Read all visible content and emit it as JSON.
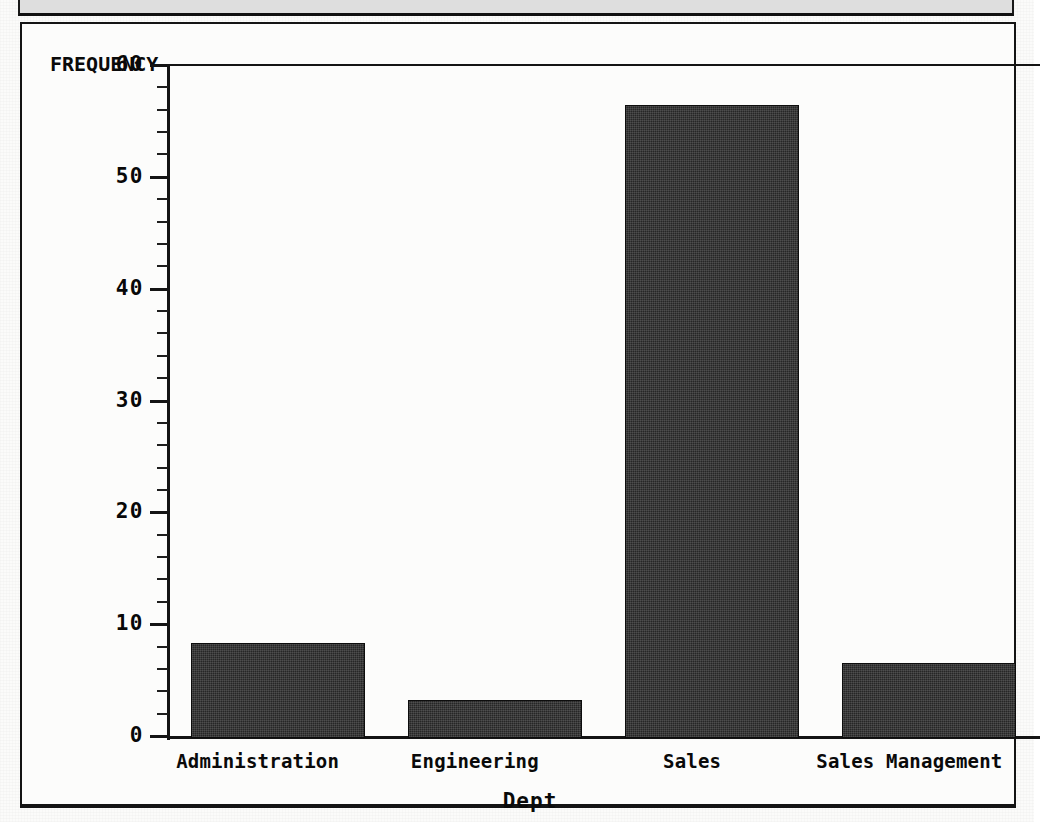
{
  "chart_data": {
    "type": "bar",
    "title": "",
    "subtitle": "",
    "xlabel": "Dept",
    "ylabel": "FREQUENCY",
    "categories": [
      "Administration",
      "Engineering",
      "Sales",
      "Sales Management"
    ],
    "values": [
      8.5,
      3.4,
      56.6,
      6.7
    ],
    "ylim": [
      0,
      60
    ],
    "yticks": [
      0,
      10,
      20,
      30,
      40,
      50,
      60
    ],
    "ytick_labels": [
      "0",
      "10",
      "20",
      "30",
      "40",
      "50",
      "60"
    ],
    "minor_tick_interval": 2,
    "grid": false,
    "legend": null,
    "bar_color": "#262626",
    "axis_color": "#141414",
    "background_color": "#fcfcfb",
    "orientation": "vertical"
  },
  "figure": {
    "y_axis_title": "FREQUENCY",
    "x_axis_title": "Dept",
    "frame": "box"
  }
}
